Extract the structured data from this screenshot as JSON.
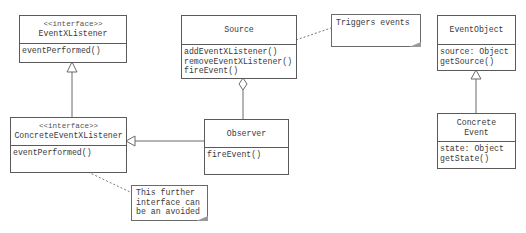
{
  "diagram": {
    "type": "UML class diagram",
    "classes": [
      {
        "id": "eventxlistener",
        "stereotype": "<<interface>>",
        "name": "EventXListener",
        "members": [
          "eventPerformed()"
        ]
      },
      {
        "id": "source",
        "stereotype": "",
        "name": "Source",
        "members": [
          "addEventXListener()",
          "removeEventXListener()",
          "fireEvent()"
        ]
      },
      {
        "id": "eventobject",
        "stereotype": "",
        "name": "EventObject",
        "members": [
          "source: Object",
          "getSource()"
        ]
      },
      {
        "id": "concreteeventxlistener",
        "stereotype": "<<interface>>",
        "name": "ConcreteEventXListener",
        "members": [
          "eventPerformed()"
        ]
      },
      {
        "id": "observer",
        "stereotype": "",
        "name": "Observer",
        "members": [
          "fireEvent()"
        ]
      },
      {
        "id": "concreteevent",
        "stereotype": "",
        "name_line1": "Concrete",
        "name_line2": "Event",
        "members": [
          "state: Object",
          "getState()"
        ]
      }
    ],
    "notes": [
      {
        "id": "triggers",
        "text": "Triggers events"
      },
      {
        "id": "further",
        "lines": [
          "This further",
          "interface can",
          "be an avoided"
        ]
      }
    ],
    "relations": [
      {
        "from": "ConcreteEventXListener",
        "to": "EventXListener",
        "type": "generalization"
      },
      {
        "from": "Observer",
        "to": "ConcreteEventXListener",
        "type": "realization/generalization"
      },
      {
        "from": "Observer",
        "to": "Source",
        "type": "aggregation"
      },
      {
        "from": "Concrete Event",
        "to": "EventObject",
        "type": "generalization"
      },
      {
        "from": "Triggers events",
        "to": "Source",
        "type": "note-link"
      },
      {
        "from": "This further interface can be an avoided",
        "to": "ConcreteEventXListener",
        "type": "note-link"
      }
    ]
  }
}
